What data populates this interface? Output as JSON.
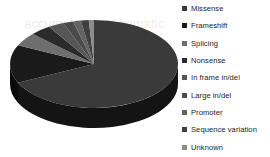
{
  "watermark": {
    "lines": [
      "accumulation of somatic",
      "mutations in the germline",
      "sequence variation"
    ]
  },
  "legend": {
    "position": "right",
    "items": [
      {
        "label": "Missense",
        "color": "#3a3a3a"
      },
      {
        "label": "Frameshift",
        "color": "#1a1a1a"
      },
      {
        "label": "Splicing",
        "color": "#6e6e6e"
      },
      {
        "label": "Nonsense",
        "color": "#2b2b2b"
      },
      {
        "label": "In frame in/del",
        "color": "#565656"
      },
      {
        "label": "Large in/del",
        "color": "#4a4a4a"
      },
      {
        "label": "Promoter",
        "color": "#646464"
      },
      {
        "label": "Sequence variation",
        "color": "#3f3f3f"
      },
      {
        "label": "Unknown",
        "color": "#8c8c8c"
      }
    ]
  },
  "chart_data": {
    "type": "pie",
    "title": "",
    "three_d": true,
    "start_angle": -90,
    "categories": [
      "Missense",
      "Frameshift",
      "Splicing",
      "Nonsense",
      "In frame in/del",
      "Large in/del",
      "Promoter",
      "Sequence variation",
      "Unknown"
    ],
    "values": [
      68,
      14,
      5,
      4,
      3,
      2,
      1.5,
      1.5,
      1
    ],
    "unit": "percent",
    "colors": [
      "#3a3a3a",
      "#1a1a1a",
      "#6e6e6e",
      "#2b2b2b",
      "#565656",
      "#4a4a4a",
      "#646464",
      "#3f3f3f",
      "#8c8c8c"
    ],
    "side_colors": [
      "#141414",
      "#0a0a0a",
      "#3a3a3a",
      "#101010",
      "#2a2a2a",
      "#222222",
      "#333333",
      "#1c1c1c",
      "#4e4e4e"
    ],
    "legend_position": "right",
    "grid": false,
    "xlabel": "",
    "ylabel": ""
  }
}
